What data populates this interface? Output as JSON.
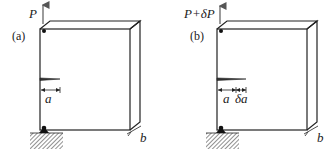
{
  "figure": {
    "colors": {
      "line": "#222222",
      "background": "#ffffff"
    },
    "panels": [
      {
        "id": "a",
        "tag": "(a)",
        "load_label": "P",
        "crack_label": "a",
        "increment_label": "",
        "thickness_label": "b"
      },
      {
        "id": "b",
        "tag": "(b)",
        "load_label": "P+δP",
        "crack_label": "a",
        "increment_label": "δa",
        "thickness_label": "b"
      }
    ]
  }
}
